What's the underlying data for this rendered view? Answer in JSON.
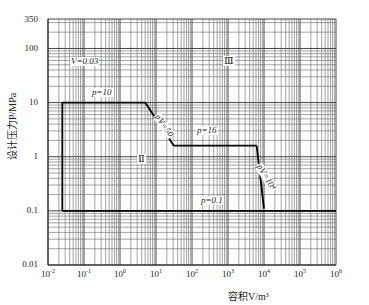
{
  "chart_data": {
    "type": "line",
    "title": "",
    "xlabel": "容积V/m³",
    "ylabel": "设计压力P/MPa",
    "xscale": "log",
    "yscale": "log",
    "xlim": [
      0.01,
      1000000
    ],
    "ylim": [
      0.01,
      350
    ],
    "grid": true,
    "x_tick_labels": [
      "10⁻²",
      "10⁻¹",
      "10⁰",
      "10¹",
      "10²",
      "10³",
      "10⁴",
      "10⁵",
      "10⁶"
    ],
    "y_tick_labels": [
      "350",
      "100",
      "10",
      "1",
      "0.1",
      "0.01"
    ],
    "series": [
      {
        "name": "p=10",
        "x": [
          0.025,
          5
        ],
        "y": [
          10,
          10
        ]
      },
      {
        "name": "pV=50",
        "x": [
          5,
          31.25
        ],
        "y": [
          10,
          1.6
        ]
      },
      {
        "name": "p=16 (1.6)",
        "x": [
          31.25,
          6250
        ],
        "y": [
          1.6,
          1.6
        ]
      },
      {
        "name": "pV=10⁴",
        "x": [
          6250,
          10000
        ],
        "y": [
          1.6,
          0.11
        ]
      },
      {
        "name": "p=0.1",
        "x": [
          0.025,
          1000000
        ],
        "y": [
          0.1,
          0.1
        ]
      },
      {
        "name": "boundary",
        "x": [
          0.025,
          0.025
        ],
        "y": [
          10,
          0.1
        ]
      }
    ],
    "annotations": [
      {
        "text": "V=0.03",
        "x": 0.03,
        "y": 35
      },
      {
        "text": "p=10",
        "x": 0.3,
        "y": 13
      },
      {
        "text": "pV=50",
        "x": 10,
        "y": 5
      },
      {
        "text": "p=16",
        "x": 100,
        "y": 2
      },
      {
        "text": "pV=10⁴",
        "x": 20000,
        "y": 0.5
      },
      {
        "text": "p=0.1",
        "x": 200,
        "y": 0.13
      },
      {
        "text": "Ⅲ",
        "x": 800,
        "y": 40
      },
      {
        "text": "Ⅱ",
        "x": 2,
        "y": 0.9
      }
    ]
  },
  "axes": {
    "ylabel": "设计压力P/MPa",
    "xlabel": "容积V/m³",
    "yticks": [
      {
        "label": "350",
        "top": 15
      },
      {
        "label": "100",
        "top": 44
      },
      {
        "label": "10",
        "top": 98
      },
      {
        "label": "1",
        "top": 152
      },
      {
        "label": "0.1",
        "top": 206
      },
      {
        "label": "0.01",
        "top": 260
      }
    ],
    "xticks": [
      {
        "base": "10",
        "exp": "-2"
      },
      {
        "base": "10",
        "exp": "-1"
      },
      {
        "base": "10",
        "exp": "0"
      },
      {
        "base": "10",
        "exp": "1"
      },
      {
        "base": "10",
        "exp": "2"
      },
      {
        "base": "10",
        "exp": "3"
      },
      {
        "base": "10",
        "exp": "4"
      },
      {
        "base": "10",
        "exp": "5"
      },
      {
        "base": "10",
        "exp": "6"
      }
    ]
  },
  "annotations": {
    "v003": "V=0.03",
    "p10": "p=10",
    "pv50": "pV=50",
    "p16": "p=16",
    "pv1e4": "pV=10⁴",
    "p01": "p=0.1",
    "region3": "Ⅲ",
    "region2": "Ⅱ"
  }
}
